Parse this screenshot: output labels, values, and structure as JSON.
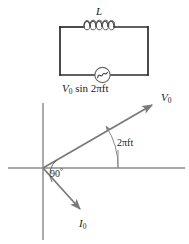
{
  "figure": {
    "type": "physics-diagram",
    "width": 189,
    "height": 244,
    "background_color": "#ffffff"
  },
  "circuit": {
    "inductor_label": "L",
    "inductor_coil_count": 4,
    "source_label_prefix": "V",
    "source_label_subscript": "0",
    "source_label_expression": " sin 2πft",
    "source_symbol": "ac-source-sine",
    "wire_color": "#2b2b2b",
    "box": {
      "left": 60,
      "top": 27,
      "right": 148,
      "bottom": 75
    }
  },
  "phasor": {
    "axis_color": "#8c8c8c",
    "vector_color": "#7a7a7a",
    "origin": {
      "x": 43,
      "y": 168
    },
    "voltage_vector": {
      "name": "V0",
      "label_prefix": "V",
      "label_subscript": "0",
      "tip": {
        "x": 155,
        "y": 103
      },
      "angle_deg": 30
    },
    "current_vector": {
      "name": "I0",
      "label_prefix": "I",
      "label_subscript": "0",
      "tip": {
        "x": 83,
        "y": 212
      },
      "angle_deg": -60
    },
    "angle_arc_label": "2πft",
    "phase_difference_label": "90",
    "phase_difference_unit": "°",
    "horizontal_axis": {
      "x1": 8,
      "x2": 185,
      "y": 168
    },
    "vertical_axis": {
      "x": 43,
      "y1": 103,
      "y2": 240
    }
  }
}
